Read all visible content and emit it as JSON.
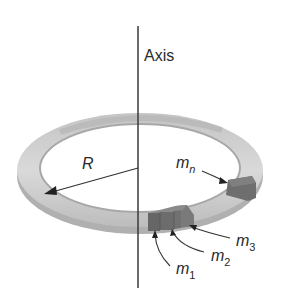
{
  "figure": {
    "axis_label": "Axis",
    "radius_label": "R",
    "masses": [
      {
        "symbol": "m",
        "subscript": "1"
      },
      {
        "symbol": "m",
        "subscript": "2"
      },
      {
        "symbol": "m",
        "subscript": "3"
      },
      {
        "symbol": "m",
        "subscript": "n"
      }
    ]
  },
  "colors": {
    "ring_light": "#d6d6d6",
    "ring_mid": "#b8b8b8",
    "ring_dark": "#9a9a9a",
    "mass_fill": "#6e6e6e",
    "mass_top": "#7d7d7d",
    "line": "#333333"
  }
}
